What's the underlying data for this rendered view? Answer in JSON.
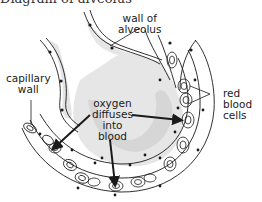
{
  "diagram": {
    "title_fragment": "Diagram of alveolus",
    "labels": {
      "wall_of_alveolus": [
        "wall of",
        "alveolus"
      ],
      "capillary_wall": [
        "capillary",
        "wall"
      ],
      "oxygen_diffuses": [
        "oxygen",
        "diffuses",
        "into",
        "blood"
      ],
      "red_blood_cells": [
        "red",
        "blood",
        "cells"
      ]
    },
    "colors": {
      "line": "#1a1a1a",
      "shadow": "#c8c8c8",
      "background": "#ffffff"
    }
  }
}
